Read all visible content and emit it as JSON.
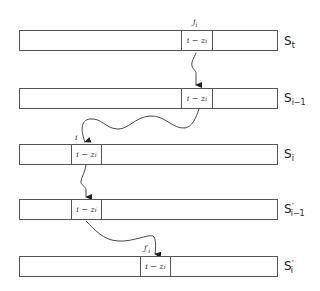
{
  "diagram": {
    "rows": [
      {
        "name": "S_t",
        "label": "S",
        "sub": "t",
        "prime": "",
        "cell_text": "i − z",
        "cell_sub": "i",
        "index_label": "j",
        "index_sub": "i"
      },
      {
        "name": "S_{i-1}",
        "label": "S",
        "sub": "i−1",
        "prime": "",
        "cell_text": "i − z",
        "cell_sub": "i",
        "index_label": "",
        "index_sub": ""
      },
      {
        "name": "S_i",
        "label": "S",
        "sub": "i",
        "prime": "",
        "cell_text": "i − z",
        "cell_sub": "i",
        "index_label": "i",
        "index_sub": ""
      },
      {
        "name": "S'_{i-1}",
        "label": "S",
        "sub": "i−1",
        "prime": "′",
        "cell_text": "i − z",
        "cell_sub": "i",
        "index_label": "",
        "index_sub": ""
      },
      {
        "name": "S'_i",
        "label": "S",
        "sub": "i",
        "prime": "′",
        "cell_text": "i − z",
        "cell_sub": "i",
        "index_label": "j′",
        "index_sub": "i"
      }
    ],
    "arrows": [
      {
        "from": "S_t",
        "to": "S_{i-1}"
      },
      {
        "from": "S_{i-1}",
        "to": "S_i"
      },
      {
        "from": "S_i",
        "to": "S'_{i-1}"
      },
      {
        "from": "S'_{i-1}",
        "to": "S'_i"
      }
    ]
  }
}
